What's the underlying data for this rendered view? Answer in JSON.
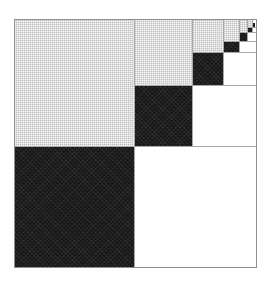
{
  "figure": {
    "description": "Nested staircase block pattern: large light-gray blocks on the upper-left diagonal with black off-diagonal blocks and white empty regions in the upper-right.",
    "canvas_width": 274,
    "canvas_height": 285,
    "background_color": "#ffffff"
  },
  "frame": {
    "name": "matrix-outline",
    "x": 14,
    "y": 19,
    "width": 243,
    "height": 249,
    "border_color": "#8e8e8e",
    "border_width": 1
  },
  "palette": {
    "gray": "#c9c9c9",
    "dark": "#151515",
    "white": "#ffffff",
    "grid": "#a8a8a8",
    "outline": "#8e8e8e"
  },
  "chart_data": {
    "type": "heatmap",
    "xlabel": "",
    "ylabel": "",
    "legend": [
      {
        "label": "gray",
        "color": "#c9c9c9"
      },
      {
        "label": "dark",
        "color": "#151515"
      },
      {
        "label": "white",
        "color": "#ffffff"
      }
    ],
    "grid": true,
    "partition_boundaries_x": [
      14,
      134,
      192,
      223,
      239,
      247,
      252,
      257
    ],
    "partition_boundaries_y": [
      19,
      27,
      32,
      41,
      52,
      85,
      146,
      268
    ],
    "blocks": [
      {
        "id": "gray-1",
        "fill": "gray",
        "x": 15,
        "y": 20,
        "w": 119,
        "h": 126
      },
      {
        "id": "gray-2",
        "fill": "gray",
        "x": 134,
        "y": 20,
        "w": 58,
        "h": 65
      },
      {
        "id": "gray-3",
        "fill": "gray",
        "x": 192,
        "y": 20,
        "w": 31,
        "h": 32
      },
      {
        "id": "gray-4",
        "fill": "gray",
        "x": 223,
        "y": 20,
        "w": 16,
        "h": 21
      },
      {
        "id": "gray-5",
        "fill": "gray",
        "x": 239,
        "y": 20,
        "w": 8,
        "h": 12
      },
      {
        "id": "gray-6",
        "fill": "gray",
        "x": 247,
        "y": 20,
        "w": 5,
        "h": 7
      },
      {
        "id": "dark-1",
        "fill": "dark",
        "x": 15,
        "y": 146,
        "w": 119,
        "h": 121
      },
      {
        "id": "dark-2",
        "fill": "dark",
        "x": 134,
        "y": 85,
        "w": 58,
        "h": 61
      },
      {
        "id": "dark-3",
        "fill": "dark",
        "x": 192,
        "y": 52,
        "w": 31,
        "h": 33
      },
      {
        "id": "dark-4",
        "fill": "dark",
        "x": 223,
        "y": 41,
        "w": 16,
        "h": 11
      },
      {
        "id": "dark-5",
        "fill": "dark",
        "x": 239,
        "y": 32,
        "w": 8,
        "h": 9
      },
      {
        "id": "dark-6",
        "fill": "dark",
        "x": 247,
        "y": 27,
        "w": 5,
        "h": 5
      },
      {
        "id": "dark-7",
        "fill": "dark",
        "x": 252,
        "y": 23,
        "w": 3,
        "h": 4
      },
      {
        "id": "white-1",
        "fill": "white",
        "x": 134,
        "y": 146,
        "w": 122,
        "h": 121
      },
      {
        "id": "white-2",
        "fill": "white",
        "x": 192,
        "y": 85,
        "w": 64,
        "h": 61
      },
      {
        "id": "white-3",
        "fill": "white",
        "x": 223,
        "y": 52,
        "w": 33,
        "h": 33
      },
      {
        "id": "white-4",
        "fill": "white",
        "x": 239,
        "y": 41,
        "w": 17,
        "h": 11
      },
      {
        "id": "white-5",
        "fill": "white",
        "x": 247,
        "y": 32,
        "w": 9,
        "h": 9
      },
      {
        "id": "white-6",
        "fill": "white",
        "x": 252,
        "y": 27,
        "w": 4,
        "h": 5
      }
    ],
    "gridlines": [
      {
        "orient": "v",
        "pos": 134,
        "from": 20,
        "to": 267
      },
      {
        "orient": "v",
        "pos": 192,
        "from": 20,
        "to": 146
      },
      {
        "orient": "v",
        "pos": 223,
        "from": 20,
        "to": 85
      },
      {
        "orient": "v",
        "pos": 239,
        "from": 20,
        "to": 52
      },
      {
        "orient": "v",
        "pos": 247,
        "from": 20,
        "to": 41
      },
      {
        "orient": "v",
        "pos": 252,
        "from": 20,
        "to": 32
      },
      {
        "orient": "h",
        "pos": 146,
        "from": 15,
        "to": 256
      },
      {
        "orient": "h",
        "pos": 85,
        "from": 134,
        "to": 256
      },
      {
        "orient": "h",
        "pos": 52,
        "from": 192,
        "to": 256
      },
      {
        "orient": "h",
        "pos": 41,
        "from": 223,
        "to": 256
      },
      {
        "orient": "h",
        "pos": 32,
        "from": 239,
        "to": 256
      },
      {
        "orient": "h",
        "pos": 27,
        "from": 247,
        "to": 256
      }
    ]
  }
}
